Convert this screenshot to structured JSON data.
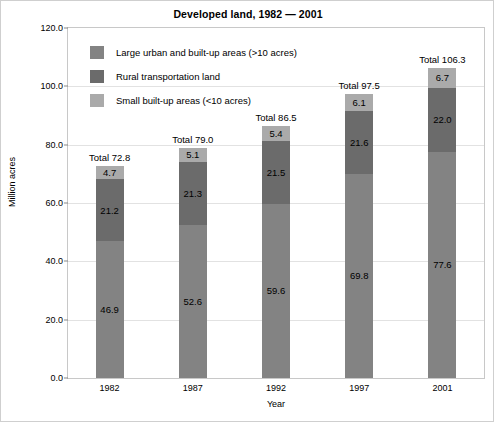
{
  "chart_data": {
    "type": "bar",
    "stacked": true,
    "title": "Developed land, 1982 — 2001",
    "xlabel": "Year",
    "ylabel": "Million acres",
    "categories": [
      "1982",
      "1987",
      "1992",
      "1997",
      "2001"
    ],
    "ylim": [
      0,
      120
    ],
    "yticks": [
      "0.0",
      "20.0",
      "40.0",
      "60.0",
      "80.0",
      "100.0",
      "120.0"
    ],
    "ytick_values": [
      0,
      20,
      40,
      60,
      80,
      100,
      120
    ],
    "grid": true,
    "legend_position": "top-left inside plot",
    "series": [
      {
        "name": "Large urban and built-up areas (>10 acres)",
        "color": "#838383",
        "values": [
          46.9,
          52.6,
          59.6,
          69.8,
          77.6
        ],
        "labels": [
          "46.9",
          "52.6",
          "59.6",
          "69.8",
          "77.6"
        ]
      },
      {
        "name": "Rural transportation land",
        "color": "#6b6b6b",
        "values": [
          21.2,
          21.3,
          21.5,
          21.6,
          22.0
        ],
        "labels": [
          "21.2",
          "21.3",
          "21.5",
          "21.6",
          "22.0"
        ]
      },
      {
        "name": "Small built-up areas (<10 acres)",
        "color": "#aaaaaa",
        "values": [
          4.7,
          5.1,
          5.4,
          6.1,
          6.7
        ],
        "labels": [
          "4.7",
          "5.1",
          "5.4",
          "6.1",
          "6.7"
        ]
      }
    ],
    "totals": [
      72.8,
      79.0,
      86.5,
      97.5,
      106.3
    ],
    "total_labels": [
      "Total 72.8",
      "Total 79.0",
      "Total 86.5",
      "Total 97.5",
      "Total 106.3"
    ]
  }
}
